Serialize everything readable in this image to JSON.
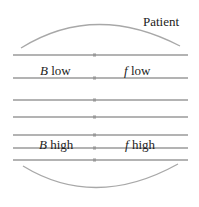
{
  "labels": {
    "patient": "Patient",
    "b_low_var": "B",
    "b_low_text": " low",
    "f_low_var": "f",
    "f_low_text": " low",
    "b_high_var": "B",
    "b_high_text": " high",
    "f_high_var": "f",
    "f_high_text": " high"
  },
  "lines_y": [
    55,
    78,
    100,
    117,
    135,
    148,
    160
  ],
  "colors": {
    "line": "#9a9a9a",
    "arc": "#a8a8a8",
    "text": "#222222"
  }
}
